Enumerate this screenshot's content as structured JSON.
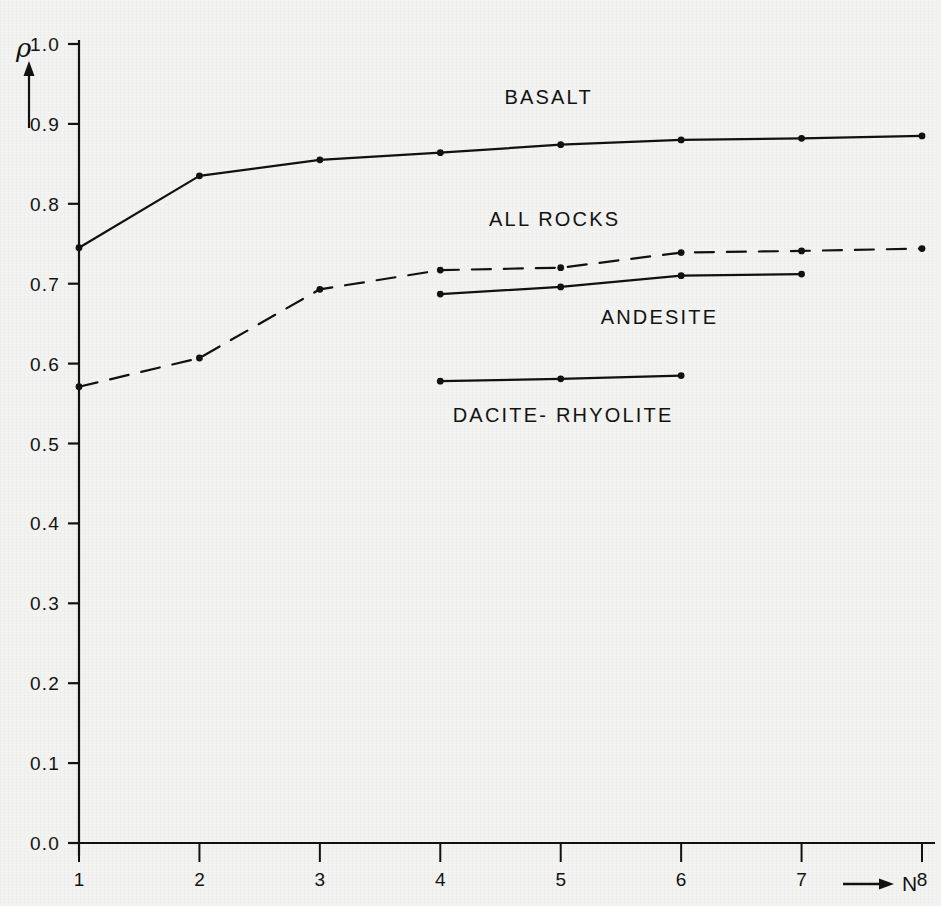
{
  "figure": {
    "background_color": "#f3f3f1",
    "line_color": "#111111",
    "axis": {
      "y": {
        "symbol": "ρ",
        "arrow": "up-arrow",
        "min": 0.0,
        "max": 1.0,
        "tick_labels": [
          "1.0",
          "0.9",
          "0.8",
          "0.7",
          "0.6",
          "0.5",
          "0.4",
          "0.3",
          "0.2",
          "0.1",
          "0.0"
        ],
        "tick_values": [
          1.0,
          0.9,
          0.8,
          0.7,
          0.6,
          0.5,
          0.4,
          0.3,
          0.2,
          0.1,
          0.0
        ]
      },
      "x": {
        "symbol": "N",
        "arrow": "right-arrow",
        "min": 1,
        "max": 8,
        "tick_labels": [
          "1",
          "2",
          "3",
          "4",
          "5",
          "6",
          "7",
          "8"
        ],
        "tick_values": [
          1,
          2,
          3,
          4,
          5,
          6,
          7,
          8
        ]
      }
    }
  },
  "chart_data": {
    "type": "line",
    "title": "",
    "xlabel": "N",
    "ylabel": "ρ",
    "xlim": [
      1,
      8
    ],
    "ylim": [
      0.0,
      1.0
    ],
    "grid": false,
    "legend": "inline-labels",
    "x": [
      1,
      2,
      3,
      4,
      5,
      6,
      7,
      8
    ],
    "series": [
      {
        "name": "BASALT",
        "label": "BASALT",
        "style": "solid",
        "marker": "dot",
        "x": [
          1,
          2,
          3,
          4,
          5,
          6,
          7,
          8
        ],
        "values": [
          0.745,
          0.835,
          0.855,
          0.864,
          0.874,
          0.88,
          0.882,
          0.885
        ],
        "label_x": 4.9,
        "label_y": 0.925
      },
      {
        "name": "ALL ROCKS",
        "label": "ALL ROCKS",
        "style": "dashed",
        "marker": "dot",
        "x": [
          1,
          2,
          3,
          4,
          5,
          6,
          7,
          8
        ],
        "values": [
          0.571,
          0.607,
          0.693,
          0.717,
          0.72,
          0.739,
          0.741,
          0.744
        ],
        "label_x": 4.95,
        "label_y": 0.772
      },
      {
        "name": "ANDESITE",
        "label": "ANDESITE",
        "style": "solid",
        "marker": "dot",
        "x": [
          4,
          5,
          6,
          7
        ],
        "values": [
          0.687,
          0.696,
          0.71,
          0.712
        ],
        "label_x": 5.82,
        "label_y": 0.65
      },
      {
        "name": "DACITE-RHYOLITE",
        "label": "DACITE- RHYOLITE",
        "style": "solid",
        "marker": "dot",
        "x": [
          4,
          5,
          6
        ],
        "values": [
          0.578,
          0.581,
          0.585
        ],
        "label_x": 5.02,
        "label_y": 0.527
      }
    ]
  }
}
